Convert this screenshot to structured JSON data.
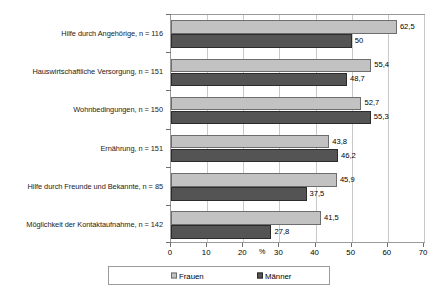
{
  "chart_data": {
    "type": "bar",
    "orientation": "horizontal",
    "title": "",
    "xlabel": "%",
    "ylabel": "",
    "xlim": [
      0,
      70
    ],
    "xticks": [
      0,
      10,
      20,
      30,
      40,
      50,
      60,
      70
    ],
    "xticklabels": [
      "0",
      "10",
      "20",
      "30",
      "40",
      "50",
      "60",
      "70"
    ],
    "grid": true,
    "legend_position": "bottom",
    "categories": [
      "Hilfe durch Angehörige, n = 116",
      "Hauswirtschaftliche Versorgung, n = 151",
      "Wohnbedingungen, n = 150",
      "Ernährung, n = 151",
      "Hilfe durch Freunde und Bekannte, n = 85",
      "Möglichkeit der Kontaktaufnahme, n = 142"
    ],
    "series": [
      {
        "name": "Frauen",
        "color": "#c2c2c2",
        "values": [
          62.5,
          55.4,
          52.7,
          43.8,
          45.9,
          41.5
        ],
        "labels": [
          "62,5",
          "55,4",
          "52,7",
          "43,8",
          "45,9",
          "41,5"
        ]
      },
      {
        "name": "Männer",
        "color": "#545454",
        "values": [
          50,
          48.7,
          55.3,
          46.2,
          37.5,
          27.8
        ],
        "labels": [
          "50",
          "48,7",
          "55,3",
          "46,2",
          "37,5",
          "27,8"
        ]
      }
    ]
  },
  "legend": {
    "entries": [
      {
        "label": "Frauen",
        "color": "#c2c2c2"
      },
      {
        "label": "Männer",
        "color": "#545454"
      }
    ]
  },
  "axis": {
    "percent_symbol": "%"
  }
}
